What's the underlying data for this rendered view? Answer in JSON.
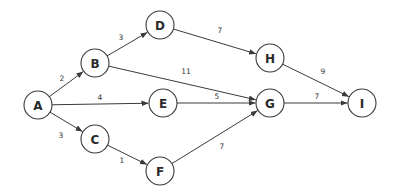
{
  "diagram": {
    "type": "directed-weighted-graph",
    "node_radius": 14,
    "colors": {
      "stroke": "#3a3a3a",
      "fill": "#ffffff",
      "text": "#2a2a2a"
    },
    "nodes": [
      {
        "id": "A",
        "label": "A",
        "x": 38,
        "y": 105
      },
      {
        "id": "B",
        "label": "B",
        "x": 95,
        "y": 63
      },
      {
        "id": "C",
        "label": "C",
        "x": 95,
        "y": 139
      },
      {
        "id": "D",
        "label": "D",
        "x": 160,
        "y": 25
      },
      {
        "id": "E",
        "label": "E",
        "x": 163,
        "y": 103
      },
      {
        "id": "F",
        "label": "F",
        "x": 160,
        "y": 171
      },
      {
        "id": "G",
        "label": "G",
        "x": 270,
        "y": 103
      },
      {
        "id": "H",
        "label": "H",
        "x": 270,
        "y": 58
      },
      {
        "id": "I",
        "label": "I",
        "x": 362,
        "y": 103
      }
    ],
    "edges": [
      {
        "from": "A",
        "to": "B",
        "weight": "2",
        "lx": 62,
        "ly": 78
      },
      {
        "from": "A",
        "to": "E",
        "weight": "4",
        "lx": 100,
        "ly": 97
      },
      {
        "from": "A",
        "to": "C",
        "weight": "3",
        "lx": 61,
        "ly": 135
      },
      {
        "from": "B",
        "to": "D",
        "weight": "3",
        "lx": 121,
        "ly": 37
      },
      {
        "from": "B",
        "to": "G",
        "weight": "11",
        "lx": 186,
        "ly": 71
      },
      {
        "from": "C",
        "to": "F",
        "weight": "1",
        "lx": 122,
        "ly": 160
      },
      {
        "from": "D",
        "to": "H",
        "weight": "7",
        "lx": 220,
        "ly": 30
      },
      {
        "from": "E",
        "to": "G",
        "weight": "5",
        "lx": 217,
        "ly": 96
      },
      {
        "from": "F",
        "to": "G",
        "weight": "7",
        "lx": 222,
        "ly": 146
      },
      {
        "from": "H",
        "to": "I",
        "weight": "9",
        "lx": 323,
        "ly": 71
      },
      {
        "from": "G",
        "to": "I",
        "weight": "7",
        "lx": 317,
        "ly": 96
      }
    ]
  }
}
